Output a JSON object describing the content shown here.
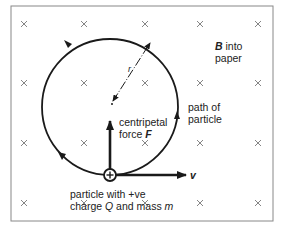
{
  "diagram": {
    "field_label": {
      "symbol": "B",
      "text": "into paper",
      "line1_rest": " into",
      "line2": "paper"
    },
    "radius_label": "r",
    "path_label": {
      "line1": "path of",
      "line2": "particle"
    },
    "force_label": {
      "line1": "centripetal",
      "line2_prefix": "force ",
      "symbol": "F"
    },
    "velocity_label": "v",
    "particle_label": {
      "line1": "particle with +ve",
      "line2_prefix": "charge ",
      "charge_symbol": "Q",
      "line2_middle": " and mass ",
      "mass_symbol": "m"
    },
    "particle_sign": "+",
    "field_marker": "×",
    "field_grid": {
      "columns_x": [
        24,
        84,
        145,
        200,
        258
      ],
      "rows_y": [
        24,
        83,
        143,
        203
      ]
    },
    "colors": {
      "stroke": "#1a1a1a",
      "cross": "#777777",
      "frame": "#888888",
      "background": "#ffffff"
    }
  }
}
